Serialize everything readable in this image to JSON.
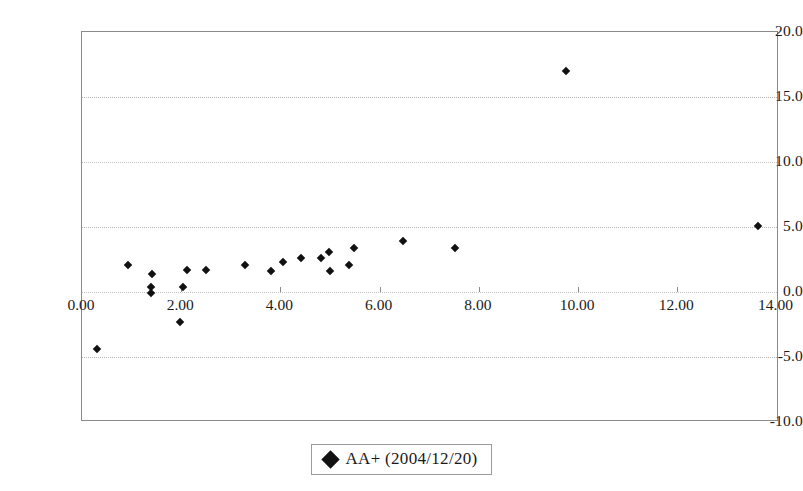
{
  "chart_data": {
    "type": "scatter",
    "title": "",
    "xlabel": "",
    "ylabel": "",
    "xlim": [
      0,
      14.05
    ],
    "ylim": [
      -10.0,
      20.0
    ],
    "grid": true,
    "legend_position": "bottom-center",
    "xticks": [
      "0.00",
      "2.00",
      "4.00",
      "6.00",
      "8.00",
      "10.00",
      "12.00",
      "14.00"
    ],
    "xtick_values": [
      0,
      2,
      4,
      6,
      8,
      10,
      12,
      14
    ],
    "yticks": [
      "20.0",
      "15.0",
      "10.0",
      "5.0",
      "0.0",
      "-5.0",
      "-10.0"
    ],
    "ytick_values": [
      20,
      15,
      10,
      5,
      0,
      -5,
      -10
    ],
    "series": [
      {
        "name": "AA+ (2004/12/20)",
        "marker": "diamond",
        "color": "#111111",
        "points": [
          [
            0.3,
            -4.35
          ],
          [
            0.93,
            2.1
          ],
          [
            1.39,
            0.35
          ],
          [
            1.39,
            -0.1
          ],
          [
            1.41,
            1.4
          ],
          [
            1.97,
            -2.3
          ],
          [
            2.03,
            0.4
          ],
          [
            2.11,
            1.7
          ],
          [
            2.5,
            1.7
          ],
          [
            3.28,
            2.1
          ],
          [
            3.81,
            1.6
          ],
          [
            4.05,
            2.3
          ],
          [
            4.41,
            2.65
          ],
          [
            4.82,
            2.6
          ],
          [
            4.98,
            3.1
          ],
          [
            5.0,
            1.6
          ],
          [
            5.38,
            2.1
          ],
          [
            5.48,
            3.4
          ],
          [
            6.48,
            3.9
          ],
          [
            7.51,
            3.35
          ],
          [
            9.76,
            17.0
          ],
          [
            13.62,
            5.05
          ]
        ]
      }
    ]
  },
  "legend": {
    "label": "AA+ (2004/12/20)",
    "marker_name": "diamond-marker"
  }
}
